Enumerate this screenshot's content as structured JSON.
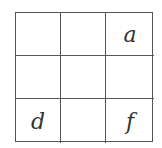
{
  "grid": {
    "rows": 3,
    "cols": 3,
    "cells": [
      [
        "",
        "",
        "a"
      ],
      [
        "",
        "",
        ""
      ],
      [
        "d",
        "",
        "f"
      ]
    ]
  }
}
